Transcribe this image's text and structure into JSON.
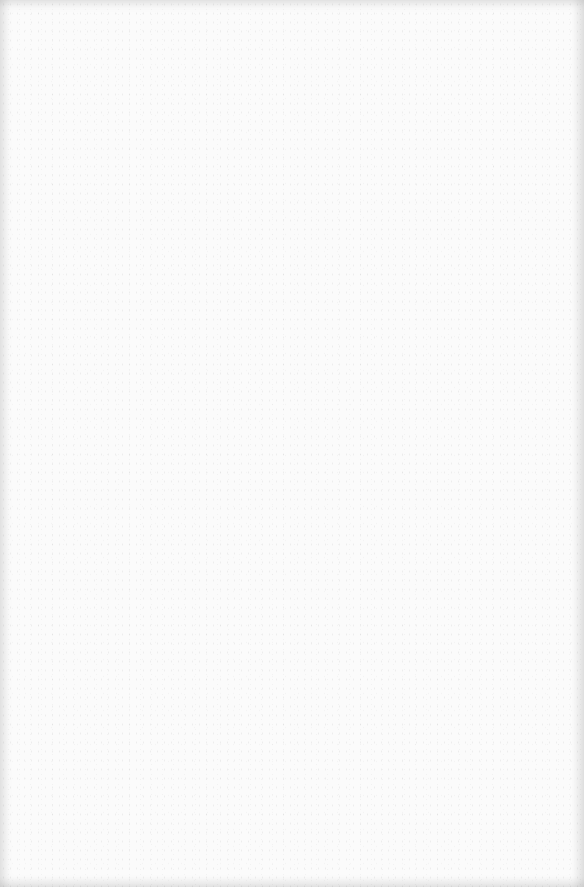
{
  "page": {
    "type": "blank-scanned-page",
    "background_color": "#fbfbfb",
    "text": ""
  }
}
